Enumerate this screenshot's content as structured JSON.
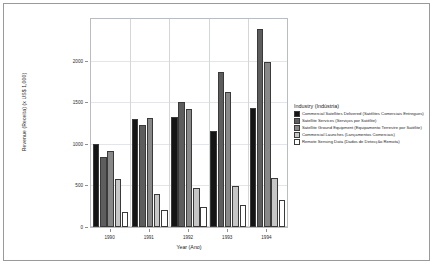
{
  "chart_data": {
    "type": "bar",
    "title": "",
    "xlabel": "Year (Ano)",
    "ylabel": "Revenue (Receita) (x US$ 1,000)",
    "categories": [
      "1990",
      "1991",
      "1992",
      "1993",
      "1994"
    ],
    "ylim": [
      0,
      2500
    ],
    "yticks": [
      0,
      500,
      1000,
      1500,
      2000
    ],
    "ytick_labels": [
      "0",
      "500",
      "1000",
      "1500",
      "2000"
    ],
    "grid": true,
    "legend_position": "right",
    "legend_title": "Industry (Indústria)",
    "series": [
      {
        "name": "Commercial Satellites Delivered (Satélites Comerciais Entregues)",
        "color": "#151515",
        "values": [
          1000,
          1300,
          1320,
          1150,
          1430
        ]
      },
      {
        "name": "Satellite Services (Serviços por Satélite)",
        "color": "#5d5d5d",
        "values": [
          840,
          1230,
          1500,
          1860,
          2380
        ]
      },
      {
        "name": "Satellite Ground Equipment (Equipamento Terrestre por Satélite)",
        "color": "#888888",
        "values": [
          910,
          1310,
          1420,
          1620,
          1980
        ]
      },
      {
        "name": "Commercial Launches (Lançamentos Comerciais)",
        "color": "#c6c6c6",
        "values": [
          580,
          400,
          470,
          490,
          590
        ]
      },
      {
        "name": "Remote Sensing Data (Dados de Detecção Remota)",
        "color": "#ffffff",
        "values": [
          180,
          200,
          240,
          270,
          320
        ]
      }
    ]
  }
}
